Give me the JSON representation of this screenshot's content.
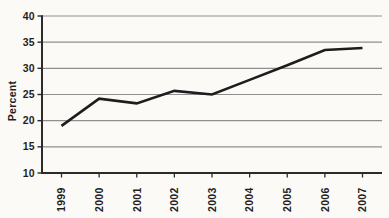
{
  "chart_data": {
    "type": "line",
    "title": "",
    "xlabel": "",
    "ylabel": "Percent",
    "categories": [
      "1999",
      "2000",
      "2001",
      "2002",
      "2003",
      "2004",
      "2005",
      "2006",
      "2007"
    ],
    "series": [
      {
        "name": "Percent",
        "values": [
          19,
          24.2,
          23.3,
          25.7,
          25,
          27.8,
          30.6,
          33.5,
          33.9
        ]
      }
    ],
    "ylim": [
      10,
      40
    ],
    "yticks": [
      10,
      15,
      20,
      25,
      30,
      35,
      40
    ],
    "grid": "horizontal",
    "legend": "none",
    "colors": {
      "line": "#1d1d1d",
      "grid": "#8f8f8f",
      "axis": "#2b2b2b",
      "text": "#1f1f1f",
      "background": "#fbfaf7"
    }
  }
}
